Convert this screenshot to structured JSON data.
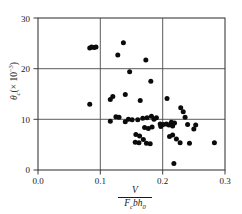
{
  "chart_data": {
    "type": "scatter",
    "title": "",
    "xlabel": "V / (F_c b h_0)",
    "ylabel": "theta_c (x 10^-3)",
    "xlabel_parts": {
      "numerator": "V",
      "denominator_F": "F",
      "denominator_F_sub": "c",
      "denominator_rest": "bh",
      "denominator_h_sub": "0"
    },
    "ylabel_parts": {
      "symbol": "θ",
      "symbol_sub": "c",
      "multiplier_open": "(",
      "multiplier": "× 10",
      "exponent": "−3",
      "multiplier_close": ")"
    },
    "xlim": [
      0.0,
      0.3
    ],
    "ylim": [
      0,
      30
    ],
    "xticks": [
      0.0,
      0.1,
      0.2,
      0.3
    ],
    "xtick_labels": [
      "0.0",
      "0.1",
      "0.2",
      "0.3"
    ],
    "yticks": [
      0,
      10,
      20,
      30
    ],
    "ytick_labels": [
      "0",
      "10",
      "20",
      "30"
    ],
    "grid": true,
    "gridlines_x": [
      0.1,
      0.2
    ],
    "gridlines_y": [
      10,
      20
    ],
    "legend": null,
    "marker": "filled-circle",
    "marker_color": "#0b0b0b",
    "points": [
      [
        0.083,
        24.1
      ],
      [
        0.086,
        24.3
      ],
      [
        0.09,
        24.2
      ],
      [
        0.093,
        24.3
      ],
      [
        0.137,
        25.1
      ],
      [
        0.128,
        22.7
      ],
      [
        0.173,
        21.7
      ],
      [
        0.147,
        19.4
      ],
      [
        0.181,
        17.5
      ],
      [
        0.12,
        14.5
      ],
      [
        0.116,
        13.9
      ],
      [
        0.14,
        14.9
      ],
      [
        0.164,
        13.7
      ],
      [
        0.207,
        14.1
      ],
      [
        0.083,
        13.0
      ],
      [
        0.229,
        12.3
      ],
      [
        0.233,
        11.5
      ],
      [
        0.236,
        10.4
      ],
      [
        0.125,
        10.5
      ],
      [
        0.13,
        10.4
      ],
      [
        0.116,
        9.6
      ],
      [
        0.14,
        9.5
      ],
      [
        0.145,
        10.0
      ],
      [
        0.151,
        9.9
      ],
      [
        0.168,
        10.2
      ],
      [
        0.175,
        10.3
      ],
      [
        0.182,
        10.6
      ],
      [
        0.186,
        10.0
      ],
      [
        0.19,
        10.3
      ],
      [
        0.16,
        9.9
      ],
      [
        0.196,
        9.1
      ],
      [
        0.201,
        9.0
      ],
      [
        0.206,
        9.1
      ],
      [
        0.21,
        8.9
      ],
      [
        0.214,
        9.4
      ],
      [
        0.216,
        8.7
      ],
      [
        0.219,
        9.3
      ],
      [
        0.197,
        8.6
      ],
      [
        0.24,
        9.0
      ],
      [
        0.25,
        8.1
      ],
      [
        0.253,
        8.9
      ],
      [
        0.171,
        8.4
      ],
      [
        0.177,
        8.2
      ],
      [
        0.183,
        8.5
      ],
      [
        0.157,
        7.0
      ],
      [
        0.163,
        6.7
      ],
      [
        0.169,
        6.0
      ],
      [
        0.156,
        5.5
      ],
      [
        0.162,
        5.4
      ],
      [
        0.174,
        5.3
      ],
      [
        0.18,
        5.2
      ],
      [
        0.211,
        6.6
      ],
      [
        0.216,
        6.9
      ],
      [
        0.222,
        6.1
      ],
      [
        0.228,
        5.4
      ],
      [
        0.243,
        5.3
      ],
      [
        0.283,
        5.4
      ],
      [
        0.218,
        1.3
      ]
    ]
  }
}
